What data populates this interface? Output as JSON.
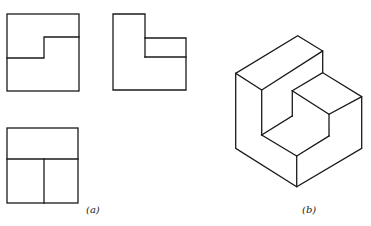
{
  "figure": {
    "panel_a": {
      "label": "(a)",
      "views": [
        "front-view",
        "side-view",
        "top-view"
      ]
    },
    "panel_b": {
      "label": "(b)",
      "views": [
        "isometric-view"
      ]
    }
  },
  "colors": {
    "line": "#1a1a1a",
    "background": "#ffffff"
  }
}
